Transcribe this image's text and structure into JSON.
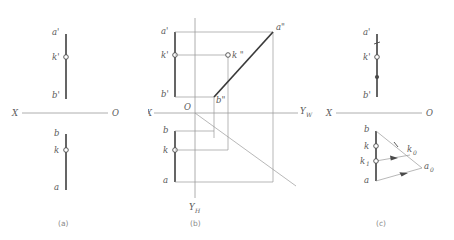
{
  "figure": {
    "title_caption_a": "(a)",
    "title_caption_b": "(b)",
    "title_caption_c": "(c)",
    "colors": {
      "stroke_dark": "#4a4a4a",
      "stroke_light": "#9a9a9a",
      "background": "#ffffff",
      "caption": "#8a8a8a"
    }
  },
  "panel_a": {
    "caption": "(a)",
    "axis": {
      "left_label": "X",
      "right_label": "O"
    },
    "labels": {
      "a_prime": "a'",
      "k_prime": "k'",
      "b_prime": "b'",
      "b": "b",
      "k": "k",
      "a": "a"
    },
    "points": [
      {
        "name": "k_prime",
        "style": "open-circle"
      },
      {
        "name": "k",
        "style": "open-circle"
      }
    ]
  },
  "panel_b": {
    "caption": "(b)",
    "axis": {
      "left_label": "X",
      "origin_label": "O",
      "right_label": "Y",
      "right_label_sub": "W",
      "bottom_label": "Y",
      "bottom_label_sub": "H"
    },
    "labels": {
      "a_prime": "a'",
      "k_prime": "k'",
      "b_prime": "b'",
      "a_dprime": "a\"",
      "k_dprime": "k \"",
      "b_dprime": "b\"",
      "b": "b",
      "k": "k",
      "a": "a"
    },
    "points": [
      {
        "name": "k_prime",
        "style": "open-circle"
      },
      {
        "name": "k_dprime",
        "style": "open-circle"
      },
      {
        "name": "k",
        "style": "open-circle"
      }
    ]
  },
  "panel_c": {
    "caption": "(c)",
    "axis": {
      "left_label": "X",
      "right_label": "O"
    },
    "labels": {
      "a_prime": "a'",
      "k_prime": "k'",
      "b_prime": "b'",
      "b": "b",
      "k": "k",
      "k_1": "k",
      "k_1_sub": "1",
      "a": "a",
      "k_0": "k",
      "k_0_sub": "0",
      "a_0": "a",
      "a_0_sub": "0"
    },
    "points": [
      {
        "name": "k_prime",
        "style": "open-circle"
      },
      {
        "name": "k",
        "style": "open-circle"
      },
      {
        "name": "k_1",
        "style": "open-circle"
      }
    ],
    "construction": {
      "tick_marks": 2,
      "arrow_marks": 2,
      "description_lines": [
        "b-a0",
        "k1-k0",
        "a-a0"
      ]
    }
  }
}
